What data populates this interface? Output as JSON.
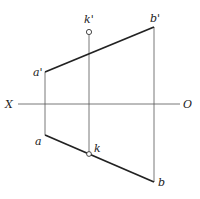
{
  "diagram": {
    "labels": {
      "a_prime": "a'",
      "b_prime": "b'",
      "k_prime": "k'",
      "a": "a",
      "b": "b",
      "k": "k",
      "x_axis": "X",
      "origin": "O"
    },
    "colors": {
      "line": "#222222",
      "thin": "#555555",
      "background": "#ffffff"
    }
  }
}
